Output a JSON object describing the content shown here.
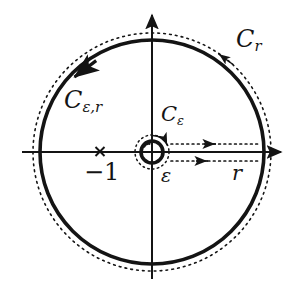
{
  "figure": {
    "background_color": "#ffffff",
    "stroke_color": "#141414",
    "width": 301,
    "height": 296
  },
  "axes": {
    "real_axis": {
      "name": "real-axis",
      "y": 152,
      "x_start": 22,
      "x_end": 287,
      "arrow": "right"
    },
    "imaginary_axis": {
      "name": "imaginary-axis",
      "x": 152,
      "y_start": 279,
      "y_end": 9,
      "arrow": "up"
    }
  },
  "contours": {
    "outer_solid": {
      "label": "C_{e,r}",
      "center_x": 152,
      "center_y": 152,
      "radius": 112,
      "style": "solid",
      "orientation": "counterclockwise"
    },
    "outer_dotted": {
      "label": "C_r",
      "center_x": 152,
      "center_y": 152,
      "radius": 119,
      "style": "dotted",
      "orientation": "counterclockwise"
    },
    "inner_solid": {
      "label": "C_e",
      "center_x": 152,
      "center_y": 152,
      "radius": 11,
      "style": "solid",
      "orientation": "clockwise"
    },
    "inner_dotted": {
      "center_x": 152,
      "center_y": 152,
      "radius": 17,
      "style": "dotted"
    },
    "branch_cut_upper": {
      "style": "dotted",
      "y": 144,
      "x_start": 170,
      "x_end": 262,
      "arrow": "right"
    },
    "branch_cut_lower": {
      "style": "dotted",
      "y": 161,
      "x_start": 170,
      "x_end": 262,
      "arrow": "right"
    }
  },
  "labels": {
    "outer_dotted_label": "C",
    "outer_dotted_sub": "r",
    "outer_solid_label": "C",
    "outer_solid_sub": "ε,r",
    "inner_label": "C",
    "inner_sub": "ε",
    "epsilon": "ε",
    "radius": "r",
    "pole": "−1"
  },
  "markers": {
    "pole": {
      "name": "pole-marker-minus-one",
      "glyph": "×",
      "x": 100,
      "y": 152,
      "label": "−1"
    }
  }
}
